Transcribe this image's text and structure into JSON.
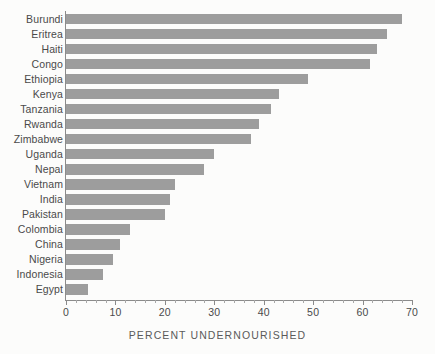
{
  "chart_data": {
    "type": "bar",
    "orientation": "horizontal",
    "title": "",
    "xlabel": "PERCENT UNDERNOURISHED",
    "ylabel": "",
    "xlim": [
      0,
      70
    ],
    "xticks": [
      0,
      10,
      20,
      30,
      40,
      50,
      60,
      70
    ],
    "xtick_labels": [
      "0",
      "10",
      "20",
      "30",
      "40",
      "50",
      "60",
      "70"
    ],
    "grid": false,
    "legend": null,
    "bar_color": "#9d9d9d",
    "background_color": "#fcfcfb",
    "axis_color": "#8b8b8b",
    "text_color": "#4a4a4a",
    "categories": [
      "Burundi",
      "Eritrea",
      "Haiti",
      "Congo",
      "Ethiopia",
      "Kenya",
      "Tanzania",
      "Rwanda",
      "Zimbabwe",
      "Uganda",
      "Nepal",
      "Vietnam",
      "India",
      "Pakistan",
      "Colombia",
      "China",
      "Nigeria",
      "Indonesia",
      "Egypt"
    ],
    "values": [
      68,
      65,
      63,
      61.5,
      49,
      43,
      41.5,
      39,
      37.5,
      30,
      28,
      22,
      21,
      20,
      13,
      11,
      9.5,
      7.5,
      4.5
    ]
  }
}
